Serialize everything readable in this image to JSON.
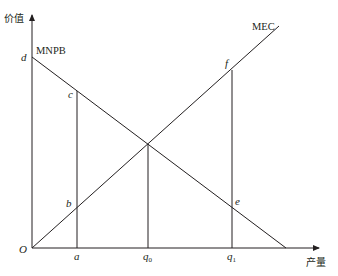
{
  "axes": {
    "y_label": "价值",
    "x_label": "产量",
    "origin_label": "O"
  },
  "curves": {
    "mnpb_label": "MNPB",
    "mec_label": "MEC"
  },
  "points": {
    "d": "d",
    "c": "c",
    "b": "b",
    "e": "e",
    "f": "f"
  },
  "x_ticks": {
    "a": "a",
    "q0_main": "q",
    "q0_sub": "0",
    "q1_main": "q",
    "q1_sub": "1"
  },
  "colors": {
    "line": "#231f20",
    "background": "#ffffff"
  }
}
